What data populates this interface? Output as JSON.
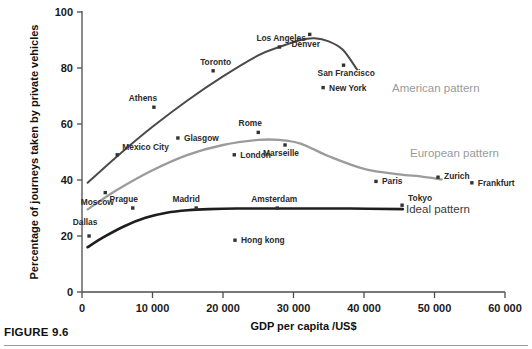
{
  "figure": {
    "caption": "FIGURE 9.6"
  },
  "axes": {
    "x": {
      "label": "GDP per capita /US$",
      "ticks": [
        "0",
        "10 000",
        "20 000",
        "30 000",
        "40 000",
        "50 000",
        "60 000"
      ],
      "tick_values": [
        0,
        10000,
        20000,
        30000,
        40000,
        50000,
        60000
      ],
      "min": 0,
      "max": 60000
    },
    "y": {
      "label": "Percentage of journeys taken by private vehicles",
      "ticks": [
        "0",
        "20",
        "40",
        "60",
        "80",
        "100"
      ],
      "tick_values": [
        0,
        20,
        40,
        60,
        80,
        100
      ],
      "min": 0,
      "max": 100
    }
  },
  "colors": {
    "american_curve": "#4a4a4a",
    "european_curve": "#9b9b9b",
    "ideal_curve": "#1e1e1e",
    "point": "#333333",
    "axis": "#4d4d4d",
    "label_grey": "#9a9a9a",
    "label_dark": "#3a3a3a"
  },
  "curve_labels": [
    {
      "text": "American pattern",
      "x": 392,
      "y": 92,
      "tone": "grey"
    },
    {
      "text": "European pattern",
      "x": 410,
      "y": 157,
      "tone": "grey"
    },
    {
      "text": "Ideal pattern",
      "x": 406,
      "y": 213,
      "tone": "dark"
    }
  ],
  "chart_data": {
    "type": "scatter",
    "title": "",
    "subtitle": "",
    "xlabel": "GDP per capita /US$",
    "ylabel": "Percentage of journeys taken by private vehicles",
    "xlim": [
      0,
      60000
    ],
    "ylim": [
      0,
      100
    ],
    "grid": false,
    "legend": "inline curve annotations at right of each trend line",
    "annotations": [
      "American pattern",
      "European pattern",
      "Ideal pattern"
    ],
    "points": [
      {
        "label": "Dallas",
        "x": 1000,
        "y": 20,
        "label_dx": -4,
        "label_dy": -11
      },
      {
        "label": "Mexico City",
        "x": 5000,
        "y": 49,
        "label_dx": 5,
        "label_dy": -5
      },
      {
        "label": "Moscow",
        "x": 3300,
        "y": 35.5,
        "label_dx": -8,
        "label_dy": 12
      },
      {
        "label": "Prague",
        "x": 7200,
        "y": 30,
        "label_dx": -9,
        "label_dy": -6
      },
      {
        "label": "Athens",
        "x": 10200,
        "y": 66,
        "label_dx": -11,
        "label_dy": -6
      },
      {
        "label": "Glasgow",
        "x": 13600,
        "y": 55,
        "label_dx": 6,
        "label_dy": 3
      },
      {
        "label": "Madrid",
        "x": 16200,
        "y": 30,
        "label_dx": -10,
        "label_dy": -6
      },
      {
        "label": "Toronto",
        "x": 18600,
        "y": 79,
        "label_dx": -13,
        "label_dy": -6
      },
      {
        "label": "London",
        "x": 21600,
        "y": 49,
        "label_dx": 6,
        "label_dy": 3
      },
      {
        "label": "Hong kong",
        "x": 21700,
        "y": 18.5,
        "label_dx": 6,
        "label_dy": 3
      },
      {
        "label": "Rome",
        "x": 25000,
        "y": 57,
        "label_dx": -8,
        "label_dy": -6
      },
      {
        "label": "Amsterdam",
        "x": 27700,
        "y": 30,
        "label_dx": -3,
        "label_dy": -6
      },
      {
        "label": "Los Angeles",
        "x": 28000,
        "y": 87.5,
        "label_dx": -23,
        "label_dy": -6
      },
      {
        "label": "Marseille",
        "x": 28800,
        "y": 52.5,
        "label_dx": -4,
        "label_dy": 11
      },
      {
        "label": "Denver",
        "x": 32300,
        "y": 92,
        "label_dx": -4,
        "label_dy": 13
      },
      {
        "label": "New York",
        "x": 34200,
        "y": 73,
        "label_dx": 6,
        "label_dy": 3
      },
      {
        "label": "San Francisco",
        "x": 37100,
        "y": 81,
        "label_dx": -26,
        "label_dy": 11
      },
      {
        "label": "Paris",
        "x": 41700,
        "y": 39.5,
        "label_dx": 6,
        "label_dy": 3
      },
      {
        "label": "Tokyo",
        "x": 45400,
        "y": 31,
        "label_dx": 6,
        "label_dy": -4
      },
      {
        "label": "Zurich",
        "x": 50500,
        "y": 41,
        "label_dx": 6,
        "label_dy": 2
      },
      {
        "label": "Frankfurt",
        "x": 55300,
        "y": 39,
        "label_dx": 6,
        "label_dy": 3
      }
    ],
    "series": [
      {
        "name": "American pattern",
        "type": "line",
        "color": "#4a4a4a",
        "x": [
          800,
          5000,
          10000,
          15000,
          20000,
          25000,
          28000,
          31000,
          33000,
          35000,
          37000,
          39000
        ],
        "y": [
          39,
          48.5,
          59,
          68.5,
          77,
          84.5,
          87.5,
          90,
          90.6,
          89.5,
          86.5,
          79.5
        ]
      },
      {
        "name": "European pattern",
        "type": "line",
        "color": "#9b9b9b",
        "x": [
          800,
          5000,
          10000,
          15000,
          20000,
          25000,
          28000,
          31000,
          35000,
          40000,
          45000,
          48000,
          51000
        ],
        "y": [
          29.5,
          36.5,
          43.5,
          49,
          52.5,
          54.3,
          54.3,
          53,
          48.5,
          44,
          42,
          41.3,
          40.2
        ]
      },
      {
        "name": "Ideal pattern",
        "type": "line",
        "color": "#1e1e1e",
        "x": [
          800,
          3000,
          6000,
          9000,
          12000,
          15000,
          18000,
          22000,
          30000,
          38000,
          45500
        ],
        "y": [
          16,
          19.5,
          23.5,
          26.5,
          28.3,
          29.2,
          29.6,
          29.8,
          29.8,
          29.8,
          29.6
        ]
      }
    ]
  }
}
